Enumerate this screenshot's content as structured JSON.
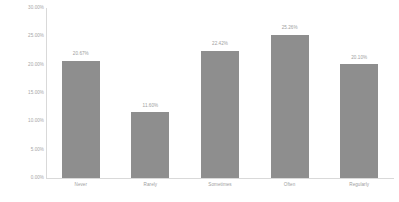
{
  "chart_data": {
    "type": "bar",
    "title": "",
    "subtitle": "",
    "xlabel": "",
    "ylabel": "",
    "categories": [
      "Never",
      "Rarely",
      "Sometimes",
      "Often",
      "Regularly"
    ],
    "values": [
      20.67,
      11.6,
      22.42,
      25.26,
      20.1
    ],
    "value_labels": [
      "20.67%",
      "11.60%",
      "22.42%",
      "25.26%",
      "20.10%"
    ],
    "ylim": [
      0,
      30
    ],
    "ytick_values": [
      0,
      5,
      10,
      15,
      20,
      25,
      30
    ],
    "ytick_labels": [
      "0.00%",
      "5.00%",
      "10.00%",
      "15.00%",
      "20.00%",
      "25.00%",
      "30.00%"
    ],
    "grid": false,
    "legend": false,
    "legend_position": "none",
    "series": [
      {
        "name": "",
        "values": [
          20.67,
          11.6,
          22.42,
          25.26,
          20.1
        ]
      }
    ],
    "colors": {
      "bar_fill": "#8e8e8e",
      "axis_line": "#d9d9d9",
      "tick_text": "#a6a6a6",
      "value_text": "#9e9e9e",
      "category_text": "#a0a0a0",
      "background": "#ffffff"
    }
  }
}
